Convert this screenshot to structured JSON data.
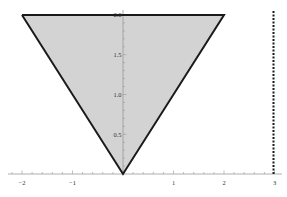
{
  "chart_data": {
    "type": "area",
    "title": "",
    "xlabel": "",
    "ylabel": "",
    "xlim": [
      -2,
      3
    ],
    "ylim": [
      0,
      2
    ],
    "grid": false,
    "legend": null,
    "series": [
      {
        "name": "inverted triangle region",
        "kind": "filled-polygon",
        "points": [
          [
            -2,
            2.0
          ],
          [
            2,
            2.0
          ],
          [
            0,
            0
          ]
        ],
        "fill": "#d3d3d3",
        "stroke": "#1a1a1a"
      },
      {
        "name": "vertical line x=3",
        "kind": "dotted-line",
        "points": [
          [
            3,
            0
          ],
          [
            3,
            2.05
          ]
        ],
        "stroke": "#1a1a1a"
      }
    ],
    "x_ticks": [
      {
        "value": -2,
        "label": "−2"
      },
      {
        "value": -1,
        "label": "−1"
      },
      {
        "value": 1,
        "label": "1"
      },
      {
        "value": 2,
        "label": "2"
      },
      {
        "value": 3,
        "label": "3"
      }
    ],
    "y_ticks": [
      {
        "value": 0.5,
        "label": "0.5"
      },
      {
        "value": 1.0,
        "label": "1.0"
      },
      {
        "value": 1.5,
        "label": "1.5"
      },
      {
        "value": 2.0,
        "label": "2.0"
      }
    ]
  },
  "colors": {
    "fill": "#d3d3d3",
    "stroke": "#1a1a1a",
    "axis": "#999999"
  }
}
